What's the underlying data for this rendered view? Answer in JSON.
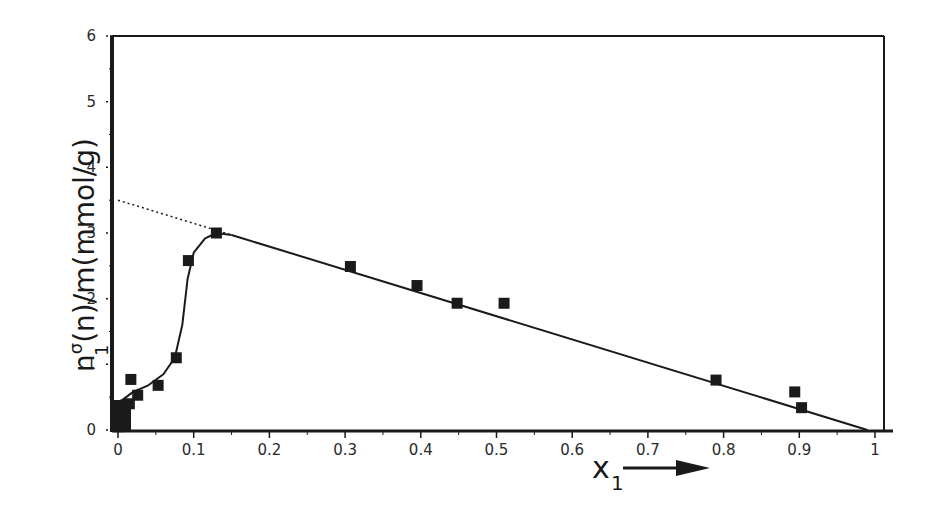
{
  "chart_data": {
    "type": "scatter",
    "title": "",
    "xlabel": "x1",
    "xlabel_main": "x",
    "xlabel_sub": "1",
    "ylabel": "n1^σ(n)/m(mmol/g)",
    "ylabel_main": "n",
    "ylabel_sub": "1",
    "ylabel_sup": "σ",
    "ylabel_rest": "(n)/m(mmol/g)",
    "xlim": [
      0,
      1
    ],
    "ylim": [
      0,
      6
    ],
    "grid": false,
    "legend": null,
    "x_ticks": [
      "0",
      "0.1",
      "0.2",
      "0.3",
      "0.4",
      "0.5",
      "0.6",
      "0.7",
      "0.8",
      "0.9",
      "1"
    ],
    "y_ticks": [
      "0",
      "1",
      "2",
      "3",
      "4",
      "5",
      "6"
    ],
    "series": [
      {
        "name": "measured",
        "marker": "filled-square",
        "points": [
          [
            0.002,
            0.05
          ],
          [
            0.004,
            0.15
          ],
          [
            0.006,
            0.25
          ],
          [
            0.008,
            0.32
          ],
          [
            0.01,
            0.38
          ],
          [
            0.015,
            0.4
          ],
          [
            0.017,
            0.77
          ],
          [
            0.026,
            0.53
          ],
          [
            0.053,
            0.68
          ],
          [
            0.077,
            1.1
          ],
          [
            0.093,
            2.58
          ],
          [
            0.13,
            3.0
          ],
          [
            0.307,
            2.49
          ],
          [
            0.395,
            2.2
          ],
          [
            0.448,
            1.93
          ],
          [
            0.51,
            1.93
          ],
          [
            0.79,
            0.76
          ],
          [
            0.894,
            0.58
          ],
          [
            0.903,
            0.34
          ]
        ]
      },
      {
        "name": "linear fit",
        "style": "solid",
        "points": [
          [
            0.15,
            2.97
          ],
          [
            0.99,
            0.0
          ]
        ]
      },
      {
        "name": "linear extrapolation",
        "style": "dotted",
        "points": [
          [
            0.0,
            3.5
          ],
          [
            0.15,
            2.97
          ]
        ]
      },
      {
        "name": "smooth curve",
        "style": "solid",
        "points": [
          [
            0.005,
            0.45
          ],
          [
            0.02,
            0.58
          ],
          [
            0.04,
            0.68
          ],
          [
            0.06,
            0.85
          ],
          [
            0.075,
            1.1
          ],
          [
            0.085,
            1.6
          ],
          [
            0.092,
            2.3
          ],
          [
            0.1,
            2.7
          ],
          [
            0.115,
            2.92
          ],
          [
            0.13,
            3.0
          ],
          [
            0.15,
            2.97
          ]
        ]
      }
    ],
    "annotations": [
      "arrow after x1 label pointing right"
    ]
  },
  "colors": {
    "ink": "#1a1a1a",
    "background": "#ffffff"
  }
}
